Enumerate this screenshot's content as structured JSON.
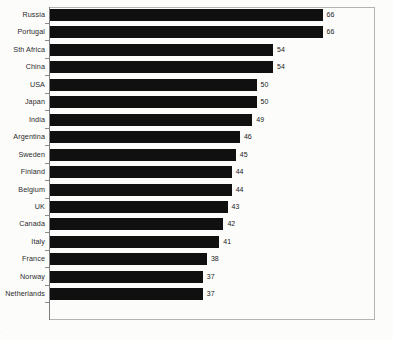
{
  "chart_data": {
    "type": "bar",
    "orientation": "horizontal",
    "title": "",
    "subtitle": "",
    "xlabel": "",
    "ylabel": "",
    "xlim": [
      0,
      79
    ],
    "grid": false,
    "legend": null,
    "categories": [
      "Russia",
      "Portugal",
      "Sth Africa",
      "China",
      "USA",
      "Japan",
      "India",
      "Argentina",
      "Sweden",
      "Finland",
      "Belgium",
      "UK",
      "Canada",
      "Italy",
      "France",
      "Norway",
      "Netherlands"
    ],
    "values": [
      66,
      66,
      54,
      54,
      50,
      50,
      49,
      46,
      45,
      44,
      44,
      43,
      42,
      41,
      38,
      37,
      37
    ],
    "value_labels": [
      "66",
      "66",
      "54",
      "54",
      "50",
      "50",
      "49",
      "46",
      "45",
      "44",
      "44",
      "43",
      "42",
      "41",
      "38",
      "37",
      "37"
    ],
    "bar_color": "#101010",
    "frame_color": "#b3b3b3",
    "axis_color": "#7d7d7d",
    "background_color": "#fcfcfb",
    "tick_labels_x": []
  },
  "footer": {
    "cropped_caption": "· · ·"
  }
}
